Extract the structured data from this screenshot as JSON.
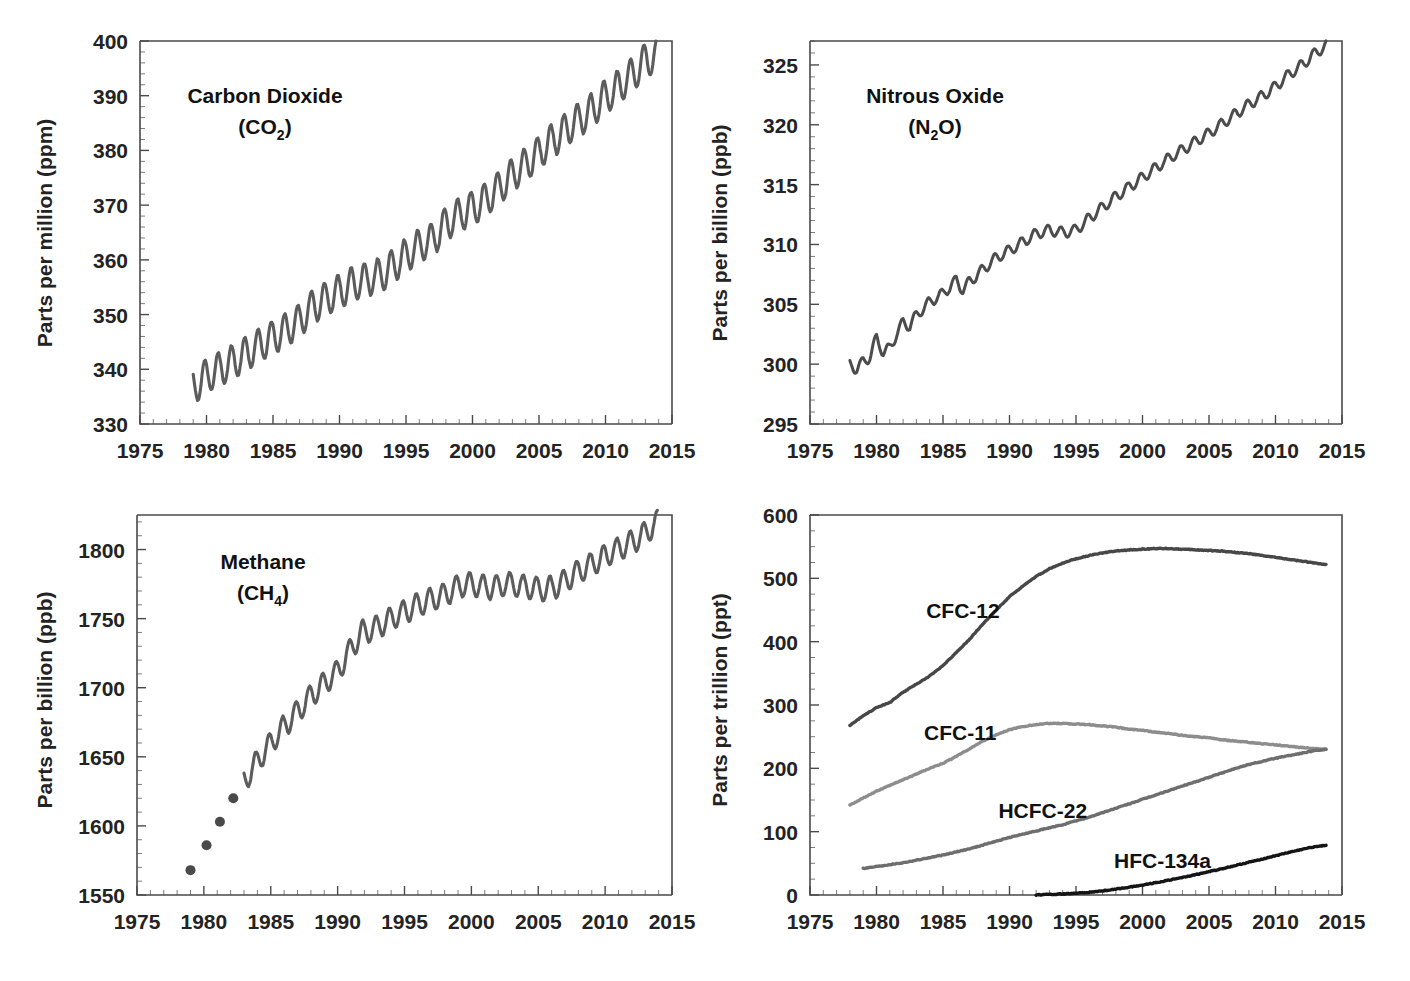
{
  "figure": {
    "panel_count": 4
  },
  "chart_data": [
    {
      "id": "carbon-dioxide",
      "type": "line",
      "title": "Carbon Dioxide",
      "formula_main": "(CO",
      "formula_sub": "2",
      "formula_tail": ")",
      "xlabel": "",
      "ylabel": "Parts per million (ppm)",
      "unit": "ppm",
      "xlim": [
        1975,
        2015
      ],
      "ylim": [
        330,
        400
      ],
      "xticks": [
        1975,
        1980,
        1985,
        1990,
        1995,
        2000,
        2005,
        2010,
        2015
      ],
      "yticks": [
        330,
        340,
        350,
        360,
        370,
        380,
        390,
        400
      ],
      "minor_y_interval": 2,
      "minor_x_interval": 1,
      "grid": false,
      "series": [
        {
          "name": "CO2 monthly mean",
          "color": "#5c5c5c",
          "width": 3.1,
          "seasonal_amplitude": 3.1,
          "x": [
            1979.0,
            1980.0,
            1981.0,
            1982.0,
            1983.0,
            1984.0,
            1985.0,
            1986.0,
            1987.0,
            1988.0,
            1989.0,
            1990.0,
            1991.0,
            1992.0,
            1993.0,
            1994.0,
            1995.0,
            1996.0,
            1997.0,
            1998.0,
            1999.0,
            2000.0,
            2001.0,
            2002.0,
            2003.0,
            2004.0,
            2005.0,
            2006.0,
            2007.0,
            2008.0,
            2009.0,
            2010.0,
            2011.0,
            2012.0,
            2013.0,
            2013.8
          ],
          "values": [
            336.8,
            338.7,
            340.1,
            341.4,
            342.8,
            344.4,
            345.9,
            347.2,
            348.9,
            351.5,
            352.9,
            354.2,
            355.6,
            356.4,
            357.1,
            358.8,
            360.8,
            362.6,
            363.7,
            366.6,
            368.3,
            369.5,
            371.0,
            373.1,
            375.6,
            377.4,
            379.6,
            381.8,
            383.7,
            385.6,
            387.4,
            389.8,
            391.6,
            393.8,
            396.5,
            397.2
          ]
        }
      ]
    },
    {
      "id": "nitrous-oxide",
      "type": "line",
      "title": "Nitrous Oxide",
      "formula_main": "(N",
      "formula_sub": "2",
      "formula_tail": "O)",
      "xlabel": "",
      "ylabel": "Parts per billion (ppb)",
      "unit": "ppb",
      "xlim": [
        1975,
        2015
      ],
      "ylim": [
        295,
        327
      ],
      "xticks": [
        1975,
        1980,
        1985,
        1990,
        1995,
        2000,
        2005,
        2010,
        2015
      ],
      "yticks": [
        295,
        300,
        305,
        310,
        315,
        320,
        325
      ],
      "minor_y_interval": 1,
      "minor_x_interval": 1,
      "grid": false,
      "series": [
        {
          "name": "N2O monthly mean",
          "color": "#4c4c4c",
          "width": 3.0,
          "seasonal_amplitude": 0.45,
          "x": [
            1978.0,
            1978.5,
            1979.0,
            1979.5,
            1980.0,
            1980.5,
            1981.0,
            1981.5,
            1982.0,
            1982.5,
            1983.0,
            1984.0,
            1985.0,
            1986.0,
            1986.5,
            1987.0,
            1988.0,
            1989.0,
            1990.0,
            1991.0,
            1992.0,
            1993.0,
            1994.0,
            1995.0,
            1996.0,
            1997.0,
            1998.0,
            1999.0,
            2000.0,
            2001.0,
            2002.0,
            2003.0,
            2004.0,
            2005.0,
            2006.0,
            2007.0,
            2008.0,
            2009.0,
            2010.0,
            2011.0,
            2012.0,
            2013.0,
            2013.8
          ],
          "values": [
            300.0,
            299.6,
            300.2,
            300.6,
            302.2,
            301.0,
            301.3,
            302.5,
            303.5,
            303.2,
            304.1,
            305.2,
            305.9,
            307.0,
            306.2,
            306.9,
            307.9,
            308.9,
            309.5,
            310.2,
            310.9,
            311.2,
            311.0,
            311.2,
            312.2,
            313.1,
            314.0,
            314.8,
            315.6,
            316.4,
            317.2,
            317.9,
            318.6,
            319.3,
            320.1,
            320.9,
            321.7,
            322.4,
            323.2,
            324.2,
            325.0,
            326.0,
            326.6
          ]
        }
      ]
    },
    {
      "id": "methane",
      "type": "line",
      "title": "Methane",
      "formula_main": "(CH",
      "formula_sub": "4",
      "formula_tail": ")",
      "xlabel": "",
      "ylabel": "Parts per billion (ppb)",
      "unit": "ppb",
      "xlim": [
        1975,
        2015
      ],
      "ylim": [
        1550,
        1825
      ],
      "xticks": [
        1975,
        1980,
        1985,
        1990,
        1995,
        2000,
        2005,
        2010,
        2015
      ],
      "yticks": [
        1550,
        1600,
        1650,
        1700,
        1750,
        1800
      ],
      "minor_y_interval": 10,
      "minor_x_interval": 1,
      "grid": false,
      "markers": {
        "name": "CH4 annual (early)",
        "color": "#4a4a4a",
        "radius": 5,
        "x": [
          1979.0,
          1980.2,
          1981.2,
          1982.2
        ],
        "values": [
          1568,
          1586,
          1603,
          1620
        ]
      },
      "series": [
        {
          "name": "CH4 monthly mean",
          "color": "#5c5c5c",
          "width": 3.1,
          "seasonal_amplitude": 8.5,
          "x": [
            1983.0,
            1984.0,
            1985.0,
            1986.0,
            1987.0,
            1988.0,
            1989.0,
            1990.0,
            1991.0,
            1991.8,
            1992.5,
            1993.0,
            1994.0,
            1995.0,
            1996.0,
            1997.0,
            1998.0,
            1998.8,
            1999.5,
            2000.5,
            2001.5,
            2002.5,
            2003.5,
            2004.5,
            2005.5,
            2006.5,
            2007.5,
            2008.5,
            2009.5,
            2010.5,
            2011.5,
            2012.5,
            2013.5,
            2013.9
          ],
          "values": [
            1632,
            1647,
            1660,
            1672,
            1683,
            1694,
            1703,
            1712,
            1728,
            1740,
            1742,
            1744,
            1750,
            1755,
            1760,
            1764,
            1767,
            1772,
            1775,
            1774,
            1772,
            1775,
            1774,
            1772,
            1771,
            1774,
            1781,
            1787,
            1792,
            1798,
            1803,
            1808,
            1816,
            1820
          ]
        }
      ]
    },
    {
      "id": "halocarbons",
      "type": "line",
      "title": "",
      "xlabel": "",
      "ylabel": "Parts per trillion (ppt)",
      "unit": "ppt",
      "xlim": [
        1975,
        2015
      ],
      "ylim": [
        0,
        600
      ],
      "xticks": [
        1975,
        1980,
        1985,
        1990,
        1995,
        2000,
        2005,
        2010,
        2015
      ],
      "yticks": [
        0,
        100,
        200,
        300,
        400,
        500,
        600
      ],
      "minor_y_interval": 25,
      "minor_x_interval": 1,
      "grid": false,
      "legend_position": "inline-annotations",
      "series": [
        {
          "name": "CFC-12",
          "label_x": 1986.5,
          "label_y": 437,
          "color": "#474747",
          "width": 3.4,
          "seasonal_amplitude": 0,
          "x": [
            1978.0,
            1979.0,
            1980.0,
            1981.0,
            1982.0,
            1983.0,
            1984.0,
            1985.0,
            1986.0,
            1987.0,
            1988.0,
            1989.0,
            1990.0,
            1991.0,
            1992.0,
            1993.0,
            1994.0,
            1995.0,
            1996.0,
            1997.0,
            1998.0,
            1999.0,
            2000.0,
            2001.0,
            2002.0,
            2003.0,
            2004.0,
            2005.0,
            2006.0,
            2007.0,
            2008.0,
            2009.0,
            2010.0,
            2011.0,
            2012.0,
            2013.0,
            2013.8
          ],
          "values": [
            268,
            283,
            296,
            304,
            320,
            333,
            346,
            362,
            383,
            404,
            428,
            450,
            471,
            488,
            503,
            515,
            524,
            531,
            536,
            540,
            543,
            545,
            546,
            547,
            547,
            546,
            545,
            544,
            543,
            541,
            539,
            536,
            533,
            530,
            527,
            524,
            522
          ]
        },
        {
          "name": "CFC-11",
          "label_x": 1986.3,
          "label_y": 245,
          "color": "#8d8d8d",
          "width": 3.4,
          "seasonal_amplitude": 0,
          "x": [
            1978.0,
            1979.0,
            1980.0,
            1981.0,
            1982.0,
            1983.0,
            1984.0,
            1985.0,
            1986.0,
            1987.0,
            1988.0,
            1989.0,
            1990.0,
            1991.0,
            1992.0,
            1993.0,
            1994.0,
            1995.0,
            1996.0,
            1997.0,
            1998.0,
            1999.0,
            2000.0,
            2001.0,
            2002.0,
            2003.0,
            2004.0,
            2005.0,
            2006.0,
            2007.0,
            2008.0,
            2009.0,
            2010.0,
            2011.0,
            2012.0,
            2013.0,
            2013.8
          ],
          "values": [
            142,
            153,
            164,
            173,
            182,
            191,
            200,
            208,
            219,
            231,
            243,
            253,
            261,
            266,
            269,
            271,
            271,
            270,
            269,
            267,
            265,
            262,
            260,
            257,
            255,
            252,
            250,
            248,
            245,
            243,
            241,
            239,
            237,
            235,
            233,
            231,
            230
          ]
        },
        {
          "name": "HCFC-22",
          "label_x": 1992.5,
          "label_y": 122,
          "color": "#6e6e6e",
          "width": 3.4,
          "seasonal_amplitude": 0,
          "x": [
            1979.0,
            1980.0,
            1981.0,
            1982.0,
            1983.0,
            1984.0,
            1985.0,
            1986.0,
            1987.0,
            1988.0,
            1989.0,
            1990.0,
            1991.0,
            1992.0,
            1993.0,
            1994.0,
            1995.0,
            1996.0,
            1997.0,
            1998.0,
            1999.0,
            2000.0,
            2001.0,
            2002.0,
            2003.0,
            2004.0,
            2005.0,
            2006.0,
            2007.0,
            2008.0,
            2009.0,
            2010.0,
            2011.0,
            2012.0,
            2013.0,
            2013.8
          ],
          "values": [
            42,
            45,
            48,
            51,
            55,
            59,
            63,
            68,
            73,
            79,
            85,
            91,
            96,
            101,
            106,
            111,
            117,
            123,
            130,
            137,
            144,
            151,
            158,
            165,
            172,
            179,
            186,
            193,
            200,
            206,
            211,
            216,
            220,
            224,
            228,
            230
          ]
        },
        {
          "name": "HFC-134a",
          "label_x": 2001.5,
          "label_y": 42,
          "color": "#151515",
          "width": 3.4,
          "seasonal_amplitude": 0,
          "x": [
            1992.0,
            1993.0,
            1994.0,
            1995.0,
            1996.0,
            1997.0,
            1998.0,
            1999.0,
            2000.0,
            2001.0,
            2002.0,
            2003.0,
            2004.0,
            2005.0,
            2006.0,
            2007.0,
            2008.0,
            2009.0,
            2010.0,
            2011.0,
            2012.0,
            2013.0,
            2013.8
          ],
          "values": [
            0.3,
            0.8,
            1.5,
            2.6,
            4.2,
            6.4,
            9.2,
            12.4,
            15.8,
            19.5,
            23.5,
            27.8,
            32.2,
            36.8,
            41.6,
            46.6,
            51.7,
            56.8,
            62.0,
            67.2,
            72.0,
            76.5,
            78.5
          ]
        }
      ]
    }
  ]
}
